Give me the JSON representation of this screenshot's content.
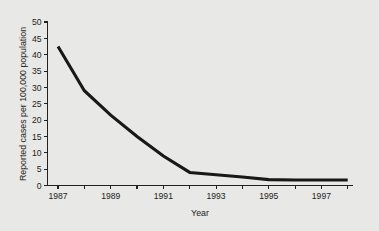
{
  "chart_data": {
    "type": "line",
    "title": "",
    "xlabel": "Year",
    "ylabel": "Reported cases per 100,000 population",
    "x": [
      1987,
      1988,
      1989,
      1990,
      1991,
      1992,
      1993,
      1994,
      1995,
      1996,
      1997,
      1998
    ],
    "values": [
      42.5,
      29.0,
      21.5,
      15.0,
      9.0,
      4.0,
      3.3,
      2.6,
      1.8,
      1.7,
      1.7,
      1.7
    ],
    "series": [
      {
        "name": "Reported cases per 100,000 population",
        "values": [
          42.5,
          29.0,
          21.5,
          15.0,
          9.0,
          4.0,
          3.3,
          2.6,
          1.8,
          1.7,
          1.7,
          1.7
        ]
      }
    ],
    "xlim": [
      1986.6,
      1998.2
    ],
    "ylim": [
      0,
      50
    ],
    "y_ticks": [
      0,
      5,
      10,
      15,
      20,
      25,
      30,
      35,
      40,
      45,
      50
    ],
    "y_tick_labels": [
      "0",
      "5",
      "10",
      "15",
      "20",
      "25",
      "30",
      "35",
      "40",
      "45",
      "50"
    ],
    "x_ticks": [
      1987,
      1988,
      1989,
      1990,
      1991,
      1992,
      1993,
      1994,
      1995,
      1996,
      1997,
      1998
    ],
    "x_tick_labels": [
      "1987",
      "",
      "1989",
      "",
      "1991",
      "",
      "1993",
      "",
      "1995",
      "",
      "1997",
      ""
    ],
    "x_labeled_ticks": [
      1987,
      1989,
      1991,
      1993,
      1995,
      1997
    ],
    "grid": false,
    "legend": false,
    "legend_position": "none",
    "line_color": "#181818",
    "background_color": "#e8e8e6",
    "axis_color": "#22211f"
  },
  "axes": {
    "y_title": "Reported cases per 100,000 population",
    "x_title": "Year"
  }
}
